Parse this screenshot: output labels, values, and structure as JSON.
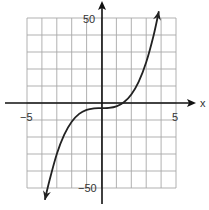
{
  "chart_data": {
    "type": "line",
    "title": "",
    "xlabel": "x",
    "ylabel": "",
    "xlim": [
      -5,
      5
    ],
    "ylim": [
      -50,
      50
    ],
    "grid": true,
    "x_grid_step": 1,
    "y_grid_step": 10,
    "x_tick_labels": [
      "-5",
      "5"
    ],
    "y_tick_labels": [
      "50",
      "-50"
    ],
    "series": [
      {
        "name": "f(x)",
        "description": "cubic curve, approx y = x^3 - 3, arrows on both ends",
        "x": [
          -3.8,
          -3.5,
          -3.0,
          -2.5,
          -2.0,
          -1.5,
          -1.0,
          -0.5,
          0.0,
          0.5,
          1.0,
          1.5,
          2.0,
          2.5,
          3.0,
          3.5,
          3.85
        ],
        "y": [
          -57,
          -45.9,
          -30,
          -18.6,
          -11,
          -6.4,
          -4,
          -3.1,
          -3,
          -2.9,
          -2,
          0.4,
          5,
          12.6,
          24,
          39.9,
          54
        ]
      }
    ],
    "colors": {
      "curve": "#222222",
      "grid": "#a8a8a8",
      "axis": "#111111"
    }
  },
  "labels": {
    "x_axis": "x",
    "x_min": "−5",
    "x_max": "5",
    "y_max": "50",
    "y_min": "−50"
  }
}
